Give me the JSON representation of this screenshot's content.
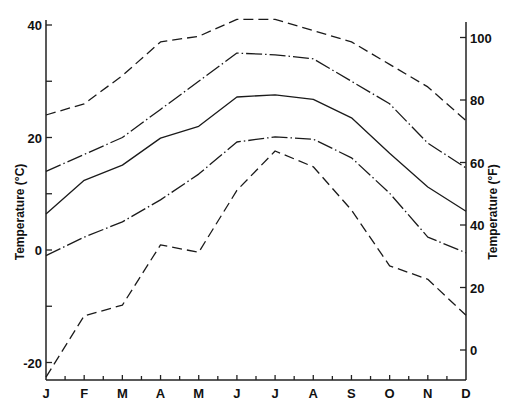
{
  "chart_data": {
    "type": "line",
    "title": "",
    "xlabel": "",
    "ylabel": "Temperature (°C)",
    "ylabel_right": "Temperature (°F)",
    "categories": [
      "J",
      "F",
      "M",
      "A",
      "M",
      "J",
      "J",
      "A",
      "S",
      "O",
      "N",
      "D"
    ],
    "ylim": [
      -23,
      42
    ],
    "ylim_right": [
      -9.4,
      107.6
    ],
    "yticks": [
      40,
      20,
      0,
      -20
    ],
    "yticks_minor": [
      30,
      10,
      -10
    ],
    "yticks_right": [
      100,
      80,
      60,
      40,
      20,
      0
    ],
    "ytick_labels": [
      "40",
      "20",
      "0",
      "-20"
    ],
    "ytick_labels_right": [
      "100",
      "80",
      "60",
      "40",
      "20",
      "0"
    ],
    "grid": false,
    "legend": "none",
    "series": [
      {
        "name": "absolute maximum",
        "style": "dashed",
        "values": [
          24,
          26,
          31,
          37,
          38,
          41,
          41,
          39,
          37,
          33,
          29,
          23
        ]
      },
      {
        "name": "mean daily maximum",
        "style": "dash-dot",
        "values": [
          14,
          17,
          20,
          25,
          30,
          35,
          34.7,
          34,
          30,
          26,
          19,
          14.6
        ]
      },
      {
        "name": "mean",
        "style": "solid",
        "values": [
          6.4,
          12.4,
          15.1,
          19.9,
          22,
          27.2,
          27.6,
          26.8,
          23.5,
          17.2,
          11.2,
          6.9
        ]
      },
      {
        "name": "mean daily minimum",
        "style": "dash-dot",
        "values": [
          -1,
          2.3,
          5,
          8.9,
          13.5,
          19.2,
          20.1,
          19.7,
          16.4,
          10.1,
          2.3,
          -0.5
        ]
      },
      {
        "name": "absolute minimum",
        "style": "dashed",
        "values": [
          -22.6,
          -11.7,
          -9.8,
          0.9,
          -0.4,
          10.6,
          17.6,
          14.8,
          7.1,
          -2.8,
          -5.2,
          -11.6
        ]
      }
    ]
  }
}
